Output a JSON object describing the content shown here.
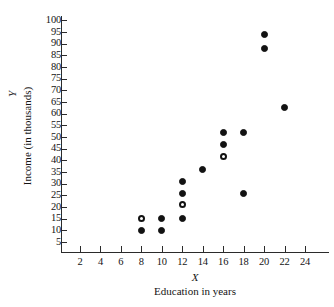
{
  "chart_data": {
    "type": "scatter",
    "title": "",
    "xlabel": "X",
    "xcaption": "Education in years",
    "ylabel": "Y",
    "ycaption": "Income (in thousands)",
    "xlim": [
      0,
      25
    ],
    "ylim": [
      0,
      102
    ],
    "grid": false,
    "legend": "none",
    "x_ticks": [
      2,
      4,
      6,
      8,
      10,
      12,
      14,
      16,
      18,
      20,
      22,
      24
    ],
    "y_ticks": [
      5,
      10,
      15,
      20,
      25,
      30,
      35,
      40,
      45,
      50,
      55,
      60,
      65,
      70,
      75,
      80,
      85,
      90,
      95,
      100
    ],
    "series": [
      {
        "name": "observed",
        "marker": "filled-circle",
        "points": [
          {
            "x": 8,
            "y": 10
          },
          {
            "x": 10,
            "y": 15
          },
          {
            "x": 10,
            "y": 10
          },
          {
            "x": 12,
            "y": 31
          },
          {
            "x": 12,
            "y": 26
          },
          {
            "x": 12,
            "y": 15
          },
          {
            "x": 14,
            "y": 36
          },
          {
            "x": 16,
            "y": 52
          },
          {
            "x": 16,
            "y": 47
          },
          {
            "x": 18,
            "y": 52
          },
          {
            "x": 18,
            "y": 26
          },
          {
            "x": 20,
            "y": 94
          },
          {
            "x": 20,
            "y": 88
          },
          {
            "x": 22,
            "y": 62.5
          }
        ]
      },
      {
        "name": "highlighted",
        "marker": "open-circle",
        "points": [
          {
            "x": 8,
            "y": 15
          },
          {
            "x": 12,
            "y": 21
          },
          {
            "x": 16,
            "y": 41.5
          }
        ]
      }
    ]
  }
}
